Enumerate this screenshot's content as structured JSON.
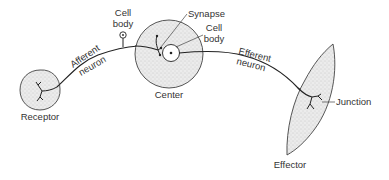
{
  "diagram": {
    "colors": {
      "line": "#222222",
      "text": "#333333",
      "stipple_fill": "#e4e4e4",
      "background": "#ffffff"
    },
    "labels": {
      "receptor": "Receptor",
      "afferent_line1": "Afferent",
      "afferent_line2": "neuron",
      "afferent_cell_body_line1": "Cell",
      "afferent_cell_body_line2": "body",
      "synapse": "Synapse",
      "center_cell_body_line1": "Cell",
      "center_cell_body_line2": "body",
      "center": "Center",
      "efferent_line1": "Efferent",
      "efferent_line2": "neuron",
      "junction": "Junction",
      "effector": "Effector"
    },
    "nodes": [
      {
        "id": "receptor",
        "label": "Receptor",
        "shape": "circle"
      },
      {
        "id": "afferent-cell-body",
        "label": "Cell body",
        "shape": "small-circle"
      },
      {
        "id": "center",
        "label": "Center",
        "shape": "circle"
      },
      {
        "id": "synapse",
        "label": "Synapse",
        "shape": "point"
      },
      {
        "id": "center-cell-body",
        "label": "Cell body",
        "shape": "small-circle"
      },
      {
        "id": "junction",
        "label": "Junction",
        "shape": "point"
      },
      {
        "id": "effector",
        "label": "Effector",
        "shape": "lens"
      }
    ],
    "edges": [
      {
        "from": "receptor",
        "to": "center",
        "label": "Afferent neuron"
      },
      {
        "from": "center",
        "to": "effector",
        "label": "Efferent neuron"
      }
    ]
  }
}
